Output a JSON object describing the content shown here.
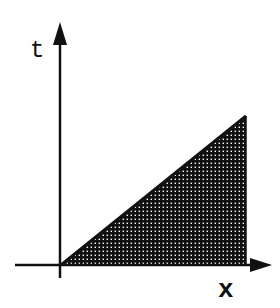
{
  "diagram": {
    "axes": {
      "vertical_label": "t",
      "horizontal_label": "x"
    },
    "region": {
      "description": "shaded right triangle under the line t = x",
      "fill_pattern": "crosshatch"
    },
    "colors": {
      "ink": "#111111",
      "background": "#ffffff"
    }
  }
}
